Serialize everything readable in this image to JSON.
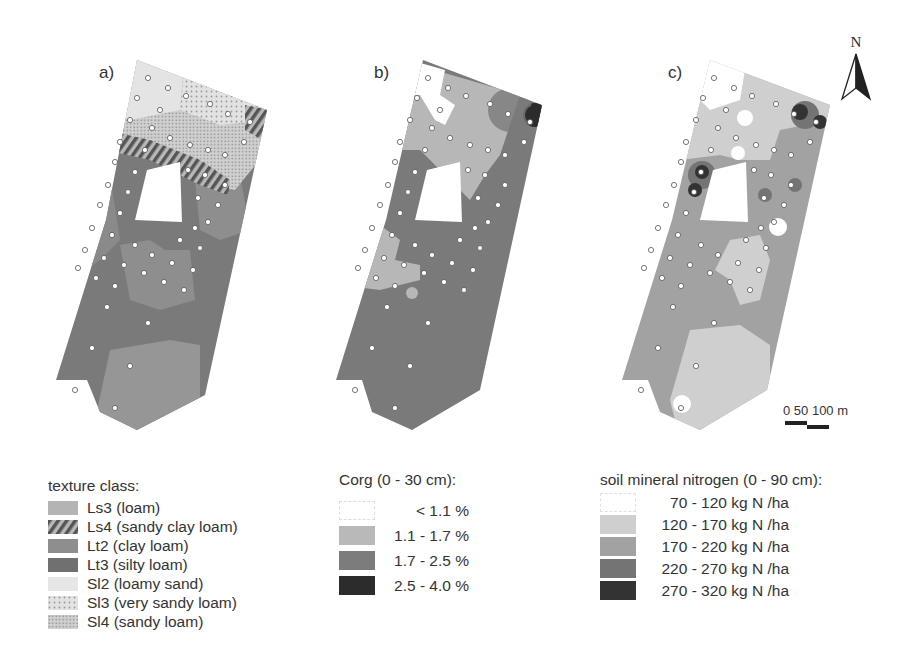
{
  "panels": [
    {
      "id": "a",
      "label": "a)"
    },
    {
      "id": "b",
      "label": "b)"
    },
    {
      "id": "c",
      "label": "c)"
    }
  ],
  "north_arrow": {
    "label": "N"
  },
  "scale_bar": {
    "labels": [
      "0",
      "50",
      "100",
      "m"
    ],
    "text": "0 50 100 m"
  },
  "legend_texture": {
    "title": "texture class:",
    "items": [
      {
        "label": "Ls3 (loam)",
        "color": "#b4b4b4",
        "pattern": "solid"
      },
      {
        "label": "Ls4 (sandy clay loam)",
        "color": "#7a7a7a",
        "pattern": "hatch"
      },
      {
        "label": "Lt2 (clay loam)",
        "color": "#8e8e8e",
        "pattern": "solid"
      },
      {
        "label": "Lt3 (silty loam)",
        "color": "#707070",
        "pattern": "solid"
      },
      {
        "label": "Sl2 (loamy sand)",
        "color": "#e6e6e6",
        "pattern": "solid"
      },
      {
        "label": "Sl3 (very sandy loam)",
        "color": "#d8d8d8",
        "pattern": "dots"
      },
      {
        "label": "Sl4 (sandy loam)",
        "color": "#c6c6c6",
        "pattern": "dense-dots"
      }
    ]
  },
  "legend_corg": {
    "title": "Corg (0 - 30 cm):",
    "items": [
      {
        "label": "< 1.1 %",
        "color": "#ffffff"
      },
      {
        "label": "1.1 - 1.7 %",
        "color": "#b9b9b9"
      },
      {
        "label": "1.7 - 2.5 %",
        "color": "#7c7c7c"
      },
      {
        "label": "2.5 - 4.0 %",
        "color": "#2c2c2c"
      }
    ]
  },
  "legend_nitrogen": {
    "title": "soil mineral nitrogen (0 - 90 cm):",
    "items": [
      {
        "label": "70 - 120 kg N /ha",
        "color": "#ffffff"
      },
      {
        "label": "120 - 170 kg N /ha",
        "color": "#cfcfcf"
      },
      {
        "label": "170 - 220 kg N /ha",
        "color": "#a2a2a2"
      },
      {
        "label": "220 - 270 kg N /ha",
        "color": "#747474"
      },
      {
        "label": "270 - 320 kg N /ha",
        "color": "#333333"
      }
    ]
  }
}
